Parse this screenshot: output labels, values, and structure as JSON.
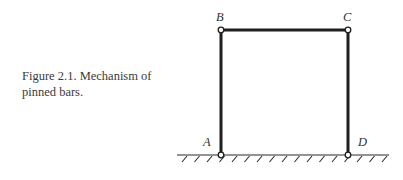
{
  "caption": {
    "line1": "Figure 2.1. Mechanism  of",
    "line2": "pinned bars."
  },
  "diagram": {
    "title": "Mechanism of pinned bars",
    "nodes": [
      {
        "id": "A",
        "label": "A",
        "support": "ground pin"
      },
      {
        "id": "B",
        "label": "B",
        "support": "free pin"
      },
      {
        "id": "C",
        "label": "C",
        "support": "free pin"
      },
      {
        "id": "D",
        "label": "D",
        "support": "ground pin"
      }
    ],
    "bars": [
      {
        "from": "A",
        "to": "B"
      },
      {
        "from": "B",
        "to": "C"
      },
      {
        "from": "C",
        "to": "D"
      }
    ],
    "colors": {
      "bar": "#1f1f1f",
      "ground": "#2a2a2a",
      "pin_fill": "#ffffff"
    }
  }
}
